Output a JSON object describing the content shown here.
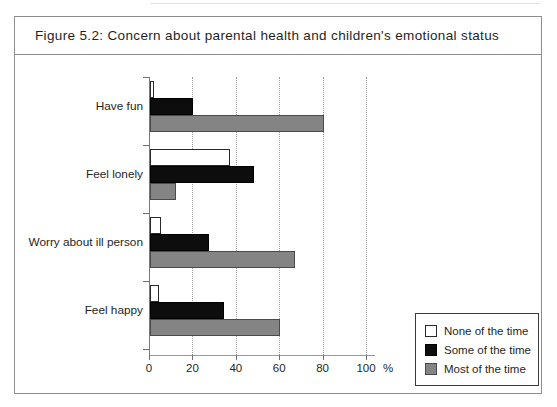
{
  "figure": {
    "caption": "Figure 5.2:  Concern about parental health and children's emotional status"
  },
  "legend": {
    "position": "bottom-right",
    "entries": [
      {
        "label": "None of the time",
        "color": "#ffffff",
        "key": "none"
      },
      {
        "label": "Some of the time",
        "color": "#0d0d0d",
        "key": "some"
      },
      {
        "label": "Most of the time",
        "color": "#848484",
        "key": "most"
      }
    ]
  },
  "axis": {
    "x_unit": "%",
    "ticks": [
      "0",
      "20",
      "40",
      "60",
      "80",
      "100"
    ]
  },
  "chart_data": {
    "type": "bar",
    "orientation": "horizontal",
    "title": "Figure 5.2:  Concern about parental health and children's emotional status",
    "xlabel": "%",
    "ylabel": "",
    "xlim": [
      0,
      100
    ],
    "xticks": [
      0,
      20,
      40,
      60,
      80,
      100
    ],
    "grid": true,
    "legend_position": "bottom-right",
    "categories": [
      "Have fun",
      "Feel lonely",
      "Worry about ill person",
      "Feel happy"
    ],
    "series": [
      {
        "name": "None of the time",
        "color": "#ffffff",
        "values": [
          2,
          37,
          5,
          4
        ]
      },
      {
        "name": "Some of the time",
        "color": "#0d0d0d",
        "values": [
          20,
          48,
          27,
          34
        ]
      },
      {
        "name": "Most of the time",
        "color": "#848484",
        "values": [
          80,
          12,
          67,
          60
        ]
      }
    ]
  }
}
